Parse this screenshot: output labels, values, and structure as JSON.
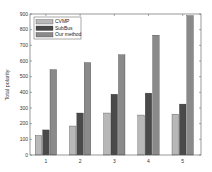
{
  "chart_data": {
    "type": "bar",
    "title": "",
    "xlabel": "",
    "ylabel": "Total polarity",
    "categories": [
      "1",
      "2",
      "3",
      "4",
      "5"
    ],
    "series": [
      {
        "name": "CVMP",
        "color": "#b8b8b8",
        "values": [
          125,
          185,
          268,
          255,
          261
        ]
      },
      {
        "name": "SubBus",
        "color": "#4a4a4a",
        "values": [
          160,
          268,
          388,
          395,
          325
        ]
      },
      {
        "name": "Our method",
        "color": "#8a8a8a",
        "values": [
          545,
          590,
          640,
          765,
          890
        ]
      }
    ],
    "ylim": [
      0,
      900
    ],
    "yticks": [
      0,
      100,
      200,
      300,
      400,
      500,
      600,
      700,
      800,
      900
    ],
    "grid": false,
    "legend_position": "upper left"
  }
}
